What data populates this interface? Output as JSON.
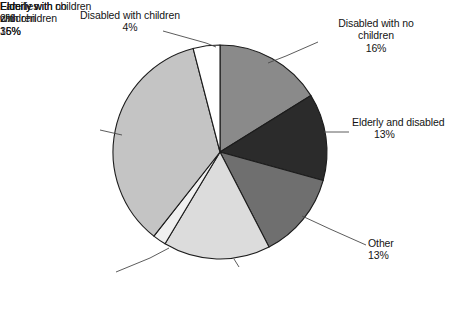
{
  "chart_data": {
    "type": "pie",
    "title": "",
    "subtitle": "",
    "xlabel": "",
    "ylabel": "",
    "legend_position": "none",
    "labels_position": "outside-callouts",
    "start_angle_deg": 0,
    "direction": "clockwise",
    "categories": [
      "Disabled with no children",
      "Elderly and disabled",
      "Other",
      "Elderly with no children",
      "Elderly with children",
      "Families with children",
      "Disabled with children"
    ],
    "values": [
      16,
      13,
      13,
      16,
      2,
      35,
      4
    ],
    "value_unit": "%",
    "colors": [
      "#8a8a8a",
      "#2b2b2b",
      "#6f6f6f",
      "#dcdcdc",
      "#f0f0f0",
      "#c4c4c4",
      "#ffffff"
    ],
    "slices": [
      {
        "name": "Disabled with no children",
        "value": 16,
        "pct_text": "16%",
        "color": "#8a8a8a"
      },
      {
        "name": "Elderly and disabled",
        "value": 13,
        "pct_text": "13%",
        "color": "#2b2b2b"
      },
      {
        "name": "Other",
        "value": 13,
        "pct_text": "13%",
        "color": "#6f6f6f"
      },
      {
        "name": "Elderly with no children",
        "value": 16,
        "pct_text": "16%",
        "color": "#dcdcdc"
      },
      {
        "name": "Elderly with children",
        "value": 2,
        "pct_text": "2%",
        "color": "#f0f0f0"
      },
      {
        "name": "Families with children",
        "value": 35,
        "pct_text": "35%",
        "color": "#c4c4c4"
      },
      {
        "name": "Disabled with children",
        "value": 4,
        "pct_text": "4%",
        "color": "#ffffff"
      }
    ]
  },
  "callouts": {
    "disabled_with_children": {
      "line1": "Disabled with children",
      "pct": "4%"
    },
    "disabled_with_no_children": {
      "line1": "Disabled with no",
      "line2": "children",
      "pct": "16%"
    },
    "elderly_and_disabled": {
      "line1": "Elderly and disabled",
      "pct": "13%"
    },
    "other": {
      "line1": "Other",
      "pct": "13%"
    },
    "elderly_with_no_children": {
      "line1": "Elderly with no",
      "line2": "children",
      "pct": "16%"
    },
    "elderly_with_children": {
      "line1": "Elderly with children",
      "pct": "2%"
    },
    "families_with_children": {
      "line1": "Families",
      "line2": "with children",
      "pct": "35%"
    }
  }
}
